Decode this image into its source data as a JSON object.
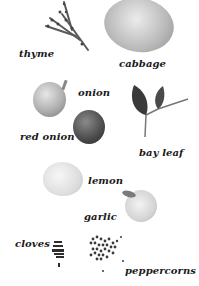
{
  "ingredients": [
    {
      "label": "thyme"
    },
    {
      "label": "cabbage"
    },
    {
      "label": "onion"
    },
    {
      "label": "red onion"
    },
    {
      "label": "bay leaf"
    },
    {
      "label": "lemon"
    },
    {
      "label": "garlic"
    },
    {
      "label": "cloves"
    },
    {
      "label": "peppercorns"
    }
  ]
}
